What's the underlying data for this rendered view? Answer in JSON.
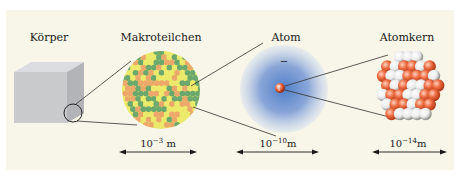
{
  "diagram": {
    "stages": [
      {
        "id": "koerper",
        "label": "Körper",
        "scale_base": "",
        "scale_exp": "",
        "scale_unit": ""
      },
      {
        "id": "makroteilchen",
        "label": "Makroteilchen",
        "scale_base": "10",
        "scale_exp": "−3",
        "scale_unit": "m"
      },
      {
        "id": "atom",
        "label": "Atom",
        "scale_base": "10",
        "scale_exp": "−10",
        "scale_unit": "m"
      },
      {
        "id": "atomkern",
        "label": "Atomkern",
        "scale_base": "10",
        "scale_exp": "−14",
        "scale_unit": "m"
      }
    ],
    "electron_symbol": "−",
    "colors": {
      "background": "#f7f6e8",
      "cube": "#c9cacc",
      "particle_green": "#6aa86e",
      "particle_yellow": "#ecea6a",
      "particle_orange": "#eca86a",
      "atom_cloud": "#8aa6d8",
      "nucleus_proton": "#e9643e",
      "nucleus_neutron": "#f2f2f2"
    }
  }
}
